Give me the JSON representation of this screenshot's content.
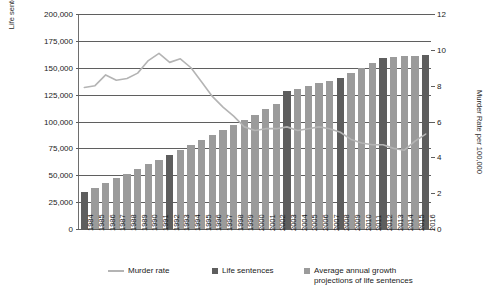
{
  "chart_data": {
    "type": "bar",
    "title": "",
    "subtitle": "",
    "xlabel": "",
    "ylabel": "Life sentences",
    "y2label": "Murder Rate per 100,000",
    "ylim": [
      0,
      200000
    ],
    "y2lim": [
      0,
      12
    ],
    "grid": true,
    "legend_position": "bottom",
    "categories": [
      "1984",
      "1985",
      "1986",
      "1987",
      "1988",
      "1989",
      "1990",
      "1991",
      "1992",
      "1993",
      "1994",
      "1995",
      "1996",
      "1997",
      "1998",
      "1999",
      "2000",
      "2001",
      "2002",
      "2003",
      "2004",
      "2005",
      "2006",
      "2007",
      "2008",
      "2009",
      "2010",
      "2011",
      "2012",
      "2013",
      "2014",
      "2015",
      "2016"
    ],
    "y_ticks": [
      "0",
      "25,000",
      "50,000",
      "75,000",
      "100,000",
      "125,000",
      "150,000",
      "175,000",
      "200,000"
    ],
    "y_tick_values": [
      0,
      25000,
      50000,
      75000,
      100000,
      125000,
      150000,
      175000,
      200000
    ],
    "y2_ticks": [
      "0",
      "2",
      "4",
      "6",
      "8",
      "10",
      "12"
    ],
    "y2_tick_values": [
      0,
      2,
      4,
      6,
      8,
      10,
      12
    ],
    "series": [
      {
        "name": "Life sentences",
        "type": "bar",
        "axis": "left",
        "color": "#5e5e5e",
        "note": "dark bars = measured life sentence counts",
        "points": [
          {
            "x": "1984",
            "y": 34000
          },
          {
            "x": "1992",
            "y": 69000
          },
          {
            "x": "2003",
            "y": 128000
          },
          {
            "x": "2008",
            "y": 140600
          },
          {
            "x": "2012",
            "y": 159500
          },
          {
            "x": "2016",
            "y": 162000
          }
        ]
      },
      {
        "name": "Average annual growth projections of life sentences",
        "type": "bar",
        "axis": "left",
        "color": "#9b9b9b",
        "note": "light bars = interpolated / projected life sentence counts",
        "points": [
          {
            "x": "1985",
            "y": 38500
          },
          {
            "x": "1986",
            "y": 43000
          },
          {
            "x": "1987",
            "y": 47000
          },
          {
            "x": "1988",
            "y": 51500
          },
          {
            "x": "1989",
            "y": 56000
          },
          {
            "x": "1990",
            "y": 60500
          },
          {
            "x": "1991",
            "y": 64500
          },
          {
            "x": "1993",
            "y": 73500
          },
          {
            "x": "1994",
            "y": 78000
          },
          {
            "x": "1995",
            "y": 83000
          },
          {
            "x": "1996",
            "y": 87500
          },
          {
            "x": "1997",
            "y": 92500
          },
          {
            "x": "1998",
            "y": 97000
          },
          {
            "x": "1999",
            "y": 101500
          },
          {
            "x": "2000",
            "y": 106500
          },
          {
            "x": "2001",
            "y": 111500
          },
          {
            "x": "2002",
            "y": 116500
          },
          {
            "x": "2004",
            "y": 130500
          },
          {
            "x": "2005",
            "y": 133000
          },
          {
            "x": "2006",
            "y": 135500
          },
          {
            "x": "2007",
            "y": 138000
          },
          {
            "x": "2009",
            "y": 145300
          },
          {
            "x": "2010",
            "y": 150000
          },
          {
            "x": "2011",
            "y": 154700
          },
          {
            "x": "2013",
            "y": 160100
          },
          {
            "x": "2014",
            "y": 160700
          },
          {
            "x": "2015",
            "y": 161400
          }
        ]
      },
      {
        "name": "Murder rate",
        "type": "line",
        "axis": "right",
        "color": "#b4b4b4",
        "values": [
          7.9,
          8.0,
          8.6,
          8.3,
          8.4,
          8.7,
          9.4,
          9.8,
          9.3,
          9.5,
          9.0,
          8.2,
          7.4,
          6.8,
          6.3,
          5.7,
          5.5,
          5.6,
          5.6,
          5.7,
          5.5,
          5.6,
          5.7,
          5.6,
          5.4,
          5.0,
          4.8,
          4.7,
          4.7,
          4.5,
          4.4,
          4.9,
          5.3
        ]
      }
    ],
    "legend": [
      {
        "label": "Murder rate",
        "marker": "line",
        "color": "#b4b4b4"
      },
      {
        "label": "Life sentences",
        "marker": "square",
        "color": "#5e5e5e"
      },
      {
        "label": "Average annual growth\nprojections of life sentences",
        "marker": "square",
        "color": "#9b9b9b"
      }
    ]
  },
  "colors": {
    "bar_actual": "#5e5e5e",
    "bar_projection": "#9b9b9b",
    "line": "#b4b4b4",
    "grid": "#5f5f5f",
    "axis": "#6e6e6e",
    "background": "#ffffff",
    "text": "#1a1a1a"
  }
}
